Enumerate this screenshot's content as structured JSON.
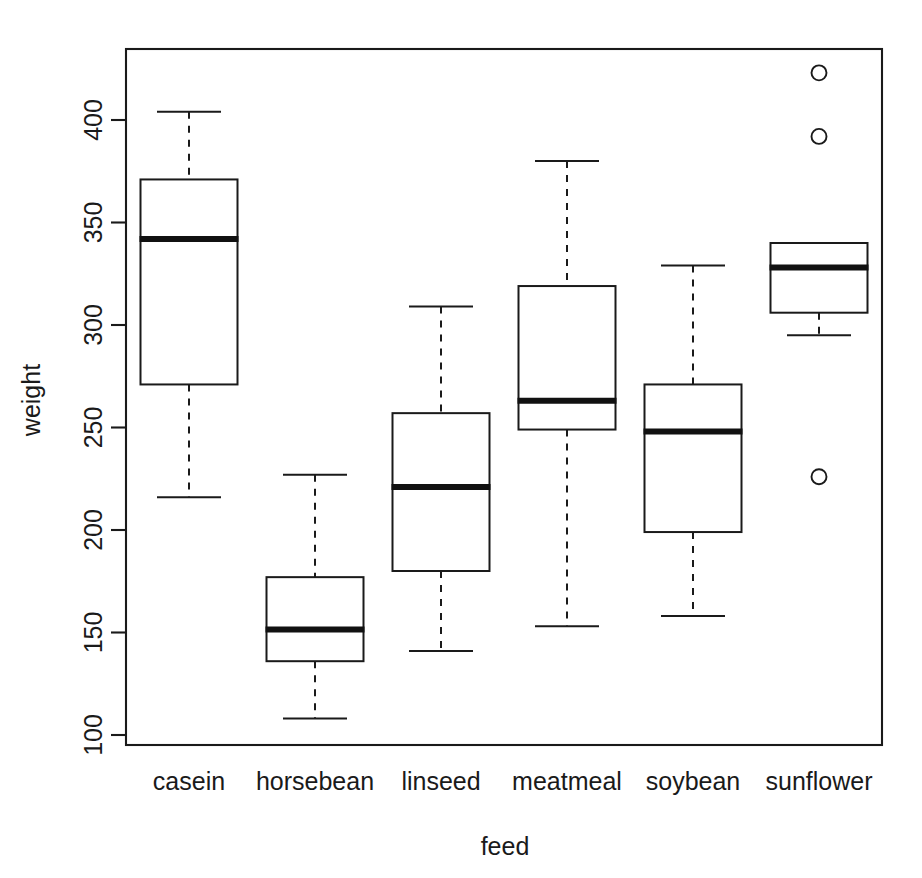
{
  "chart_data": {
    "type": "boxplot",
    "title": "",
    "subtitle": "",
    "xlabel": "feed",
    "ylabel": "weight",
    "categories": [
      "casein",
      "horsebean",
      "linseed",
      "meatmeal",
      "soybean",
      "sunflower"
    ],
    "ylim": [
      96,
      435
    ],
    "yticks": [
      100,
      150,
      200,
      250,
      300,
      350,
      400
    ],
    "ytick_labels": [
      "100",
      "150",
      "200",
      "250",
      "300",
      "350",
      "400"
    ],
    "grid": false,
    "legend": null,
    "boxes": [
      {
        "category": "casein",
        "whisker_low": 216,
        "q1": 271,
        "median": 342,
        "q3": 371,
        "whisker_high": 404,
        "outliers": []
      },
      {
        "category": "horsebean",
        "whisker_low": 108,
        "q1": 136,
        "median": 151.5,
        "q3": 177,
        "whisker_high": 227,
        "outliers": []
      },
      {
        "category": "linseed",
        "whisker_low": 141,
        "q1": 180,
        "median": 221,
        "q3": 257,
        "whisker_high": 309,
        "outliers": []
      },
      {
        "category": "meatmeal",
        "whisker_low": 153,
        "q1": 249,
        "median": 263,
        "q3": 319,
        "whisker_high": 380,
        "outliers": []
      },
      {
        "category": "soybean",
        "whisker_low": 158,
        "q1": 199,
        "median": 248,
        "q3": 271,
        "whisker_high": 329,
        "outliers": []
      },
      {
        "category": "sunflower",
        "whisker_low": 295,
        "q1": 306,
        "median": 328,
        "q3": 340,
        "whisker_high": 340,
        "outliers": [
          423,
          392,
          226
        ]
      }
    ]
  },
  "axes": {
    "y_title": "weight",
    "x_title": "feed",
    "y_tick_labels": [
      "400",
      "350",
      "300",
      "250",
      "200",
      "150",
      "100"
    ],
    "x_tick_labels": [
      "casein",
      "horsebean",
      "linseed",
      "meatmeal",
      "soybean",
      "sunflower"
    ]
  },
  "style": {
    "line_color": "#1a1a1a",
    "median_color": "#111111",
    "box_fill": "#ffffff",
    "background": "#ffffff"
  }
}
